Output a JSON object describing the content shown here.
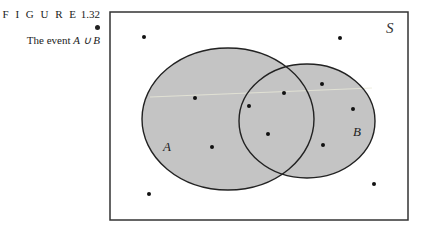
{
  "caption": {
    "figure_label": "F I G U R E",
    "figure_number": "1.32",
    "title_prefix": "The event",
    "title_expr": "A ∪ B"
  },
  "diagram": {
    "sample_space_label": "S",
    "set_a_label": "A",
    "set_b_label": "B",
    "colors": {
      "fill": "#c4c4c4",
      "stroke": "#222222",
      "background": "#ffffff"
    },
    "points": [
      {
        "x": 144,
        "y": 37
      },
      {
        "x": 340,
        "y": 38
      },
      {
        "x": 195,
        "y": 98
      },
      {
        "x": 284,
        "y": 93
      },
      {
        "x": 249,
        "y": 106
      },
      {
        "x": 322,
        "y": 84
      },
      {
        "x": 353,
        "y": 109
      },
      {
        "x": 268,
        "y": 134
      },
      {
        "x": 212,
        "y": 147
      },
      {
        "x": 323,
        "y": 145
      },
      {
        "x": 149,
        "y": 194
      },
      {
        "x": 374,
        "y": 184
      }
    ]
  }
}
